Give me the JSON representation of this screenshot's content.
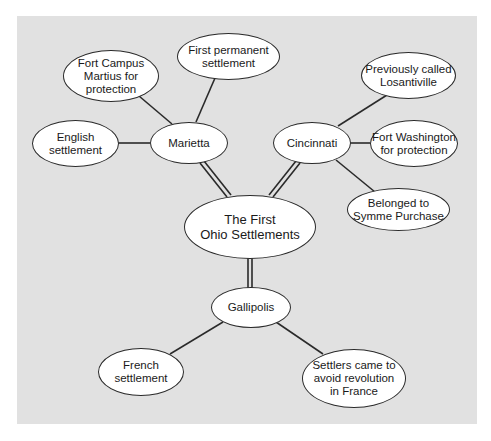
{
  "diagram": {
    "title": "The First Ohio Settlements",
    "background_color": "#e1e1e1",
    "center": {
      "label": "The First\nOhio Settlements"
    },
    "hubs": [
      {
        "label": "Marietta",
        "details": [
          "Fort Campus\nMartius for\nprotection",
          "First permanent\nsettlement",
          "English\nsettlement"
        ]
      },
      {
        "label": "Cincinnati",
        "details": [
          "Previously called\nLosantiville",
          "Fort Washington\nfor protection",
          "Belonged to\nSymme Purchase"
        ]
      },
      {
        "label": "Gallipolis",
        "details": [
          "French\nsettlement",
          "Settlers came to\navoid revolution\nin France"
        ]
      }
    ]
  }
}
